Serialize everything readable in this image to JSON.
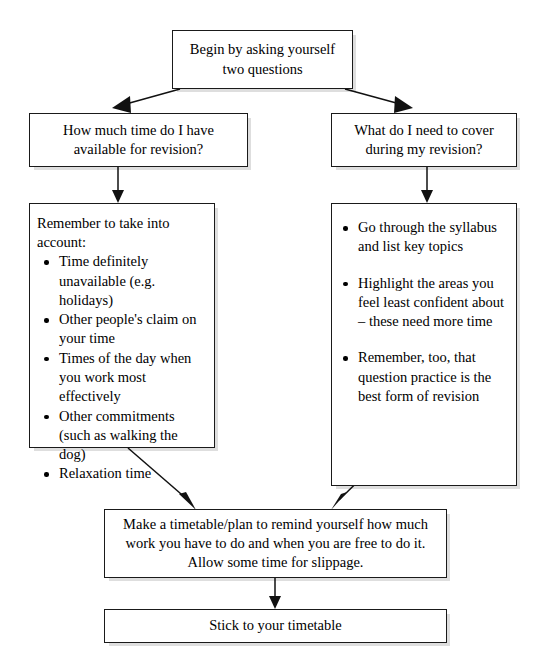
{
  "diagram": {
    "type": "flowchart",
    "colors": {
      "box_border": "#1a1a1a",
      "box_fill": "#ffffff",
      "arrow": "#111111",
      "page_background": "#ffffff"
    },
    "nodes": {
      "start": {
        "id": "start",
        "text": "Begin by asking yourself two questions",
        "lines": [
          "Begin by asking yourself",
          "two questions"
        ]
      },
      "question_left": {
        "id": "question-time-available",
        "text": "How much time do I have available for revision?",
        "lines": [
          "How much time do I have",
          "available for revision?"
        ]
      },
      "question_right": {
        "id": "question-what-to-cover",
        "text": "What do I need to cover during my revision?",
        "lines": [
          "What do I need to cover",
          "during my revision?"
        ]
      },
      "list_left": {
        "id": "take-into-account-list",
        "intro": "Remember to take into account:",
        "bullets": [
          "Time definitely unavailable (e.g. holidays)",
          "Other people's claim on your time",
          "Times of the day when you work most effectively",
          "Other commitments (such as walking the dog)",
          "Relaxation time"
        ]
      },
      "list_right": {
        "id": "revision-coverage-list",
        "bullets": [
          "Go through the syllabus and list key topics",
          "Highlight the areas you feel least confident about – these need more time",
          "Remember, too, that question practice is the best form of revision"
        ]
      },
      "timetable": {
        "id": "make-timetable",
        "text": "Make a timetable/plan to remind yourself how much work you have to do and when you are free to do it. Allow some time for slippage.",
        "lines": [
          "Make a timetable/plan to remind yourself how much",
          "work you have to do and when you are free to do it.",
          "Allow some time for slippage."
        ]
      },
      "stick": {
        "id": "stick-to-timetable",
        "text": "Stick to your timetable"
      }
    },
    "edges": [
      {
        "id": "start-to-left-question",
        "from": "start",
        "to": "question_left",
        "style": "diagonal-arrow"
      },
      {
        "id": "start-to-right-question",
        "from": "start",
        "to": "question_right",
        "style": "diagonal-arrow"
      },
      {
        "id": "left-question-to-left-list",
        "from": "question_left",
        "to": "list_left",
        "style": "vertical-arrow"
      },
      {
        "id": "right-question-to-right-list",
        "from": "question_right",
        "to": "list_right",
        "style": "vertical-arrow"
      },
      {
        "id": "left-list-to-timetable",
        "from": "list_left",
        "to": "timetable",
        "style": "diagonal-arrow"
      },
      {
        "id": "right-list-to-timetable",
        "from": "list_right",
        "to": "timetable",
        "style": "diagonal-arrow"
      },
      {
        "id": "timetable-to-stick",
        "from": "timetable",
        "to": "stick",
        "style": "vertical-arrow"
      }
    ]
  }
}
